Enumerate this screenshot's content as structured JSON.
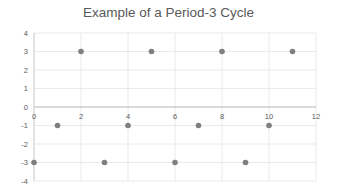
{
  "chart_data": {
    "type": "scatter",
    "title": "Example of a Period-3 Cycle",
    "xlabel": "",
    "ylabel": "",
    "xlim": [
      0,
      12
    ],
    "ylim": [
      -4,
      4
    ],
    "x_ticks": [
      0,
      2,
      4,
      6,
      8,
      10,
      12
    ],
    "y_ticks": [
      4,
      3,
      2,
      1,
      0,
      -1,
      -2,
      -3,
      -4
    ],
    "grid": true,
    "legend": "none",
    "marker_color": "#7f7f7f",
    "series": [
      {
        "name": "Series1",
        "x": [
          0,
          1,
          2,
          3,
          4,
          5,
          6,
          7,
          8,
          9,
          10,
          11
        ],
        "y": [
          -3,
          -1,
          3,
          -3,
          -1,
          3,
          -3,
          -1,
          3,
          -3,
          -1,
          3
        ]
      }
    ]
  }
}
